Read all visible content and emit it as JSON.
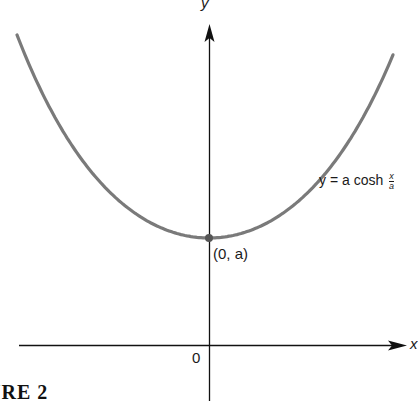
{
  "figure": {
    "caption": "FIGURE 2",
    "caption_visible": "URE 2",
    "axes": {
      "x_label": "x",
      "y_label": "y",
      "origin_label": "0"
    },
    "curve": {
      "equation_prefix": "y = a cosh",
      "fraction_numerator": "x",
      "fraction_denominator": "a",
      "color": "#7a7a7a"
    },
    "vertex": {
      "label": "(0, a)"
    }
  },
  "chart_data": {
    "type": "line",
    "title": "",
    "xlabel": "x",
    "ylabel": "y",
    "series": [
      {
        "name": "y = a cosh(x/a)",
        "function": "a*cosh(x/a)"
      }
    ],
    "annotations": [
      {
        "text": "(0, a)",
        "at": [
          0,
          "a"
        ]
      },
      {
        "text": "0",
        "at": [
          0,
          0
        ]
      }
    ],
    "grid": false
  }
}
